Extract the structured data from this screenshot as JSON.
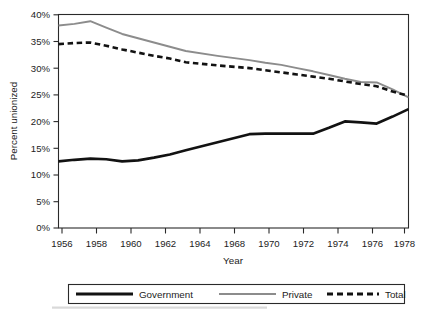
{
  "chart_data": {
    "type": "line",
    "title": "",
    "xlabel": "Year",
    "ylabel": "Percent unionized",
    "x": [
      1956,
      1957,
      1958,
      1959,
      1960,
      1961,
      1962,
      1963,
      1964,
      1966,
      1968,
      1969,
      1970,
      1971,
      1972,
      1973,
      1974,
      1975,
      1976,
      1977,
      1978
    ],
    "xlim": [
      1956,
      1978
    ],
    "ylim": [
      0,
      40
    ],
    "grid": false,
    "legend_position": "bottom",
    "x_tick_labels": [
      "1956",
      "1958",
      "1960",
      "1962",
      "1964",
      "1968",
      "1970",
      "1972",
      "1974",
      "1976",
      "1978"
    ],
    "x_tick_values": [
      1956,
      1958,
      1960,
      1962,
      1964,
      1968,
      1970,
      1972,
      1974,
      1976,
      1978
    ],
    "y_tick_labels": [
      "0%",
      "5%",
      "10%",
      "15%",
      "20%",
      "25%",
      "30%",
      "35%",
      "40%"
    ],
    "y_tick_values": [
      0,
      5,
      10,
      15,
      20,
      25,
      30,
      35,
      40
    ],
    "series": [
      {
        "name": "Government",
        "style": "solid-thick-black",
        "color": "#121212",
        "values": [
          12.5,
          12.8,
          13.0,
          12.9,
          12.5,
          12.7,
          13.2,
          13.8,
          14.6,
          16.1,
          17.6,
          17.7,
          17.7,
          17.7,
          17.7,
          18.8,
          20.0,
          19.8,
          19.6,
          20.9,
          22.3
        ]
      },
      {
        "name": "Private",
        "style": "solid-gray",
        "color": "#8c8c8c",
        "values": [
          38.0,
          38.3,
          38.8,
          37.6,
          36.4,
          35.6,
          34.8,
          34.0,
          33.2,
          32.3,
          31.5,
          31.0,
          30.6,
          30.0,
          29.4,
          28.7,
          28.0,
          27.4,
          27.3,
          26.0,
          24.5
        ]
      },
      {
        "name": "Total",
        "style": "dashed-thick-black",
        "color": "#121212",
        "values": [
          34.5,
          34.7,
          34.8,
          34.2,
          33.5,
          32.9,
          32.3,
          31.8,
          31.1,
          30.5,
          30.0,
          29.6,
          29.2,
          28.8,
          28.4,
          28.0,
          27.5,
          27.0,
          26.6,
          25.6,
          24.8
        ]
      }
    ]
  },
  "axes": {
    "y_title": "Percent unionized",
    "x_title": "Year",
    "y_ticks": [
      {
        "label": "40%",
        "value": 40
      },
      {
        "label": "35%",
        "value": 35
      },
      {
        "label": "30%",
        "value": 30
      },
      {
        "label": "25%",
        "value": 25
      },
      {
        "label": "20%",
        "value": 20
      },
      {
        "label": "15%",
        "value": 15
      },
      {
        "label": "10%",
        "value": 10
      },
      {
        "label": "5%",
        "value": 5
      },
      {
        "label": "0%",
        "value": 0
      }
    ],
    "x_ticks": [
      {
        "label": "1956",
        "value": 1956
      },
      {
        "label": "1958",
        "value": 1958
      },
      {
        "label": "1960",
        "value": 1960
      },
      {
        "label": "1962",
        "value": 1962
      },
      {
        "label": "1964",
        "value": 1964
      },
      {
        "label": "1968",
        "value": 1968
      },
      {
        "label": "1970",
        "value": 1970
      },
      {
        "label": "1972",
        "value": 1972
      },
      {
        "label": "1974",
        "value": 1974
      },
      {
        "label": "1976",
        "value": 1976
      },
      {
        "label": "1978",
        "value": 1978
      }
    ]
  },
  "legend": {
    "items": [
      {
        "label": "Government",
        "swatch": "solid-thick-black",
        "color": "#121212"
      },
      {
        "label": "Private",
        "swatch": "solid-gray",
        "color": "#8c8c8c"
      },
      {
        "label": "Total",
        "swatch": "dashed-thick-black",
        "color": "#121212"
      }
    ]
  }
}
